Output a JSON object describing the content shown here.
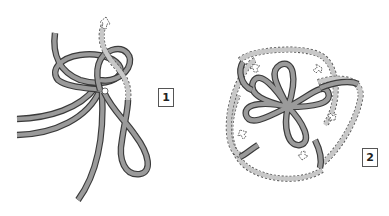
{
  "figure": {
    "steps": [
      {
        "label": "1"
      },
      {
        "label": "2"
      }
    ],
    "colors": {
      "cord_fill": "#9a9a9a",
      "cord_outline": "#3a3a3a",
      "guide_dash": "#555555",
      "background": "#ffffff"
    }
  }
}
